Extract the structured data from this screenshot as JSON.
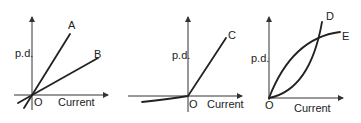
{
  "figure": {
    "panels": [
      {
        "id": "panel-1",
        "y_label": "p.d.",
        "x_label": "Current",
        "origin_label": "O",
        "curves": [
          {
            "label": "A",
            "shape": "straight line through origin, steep slope, extends into negative quadrant"
          },
          {
            "label": "B",
            "shape": "straight line through origin, shallow slope, extends into negative quadrant"
          }
        ]
      },
      {
        "id": "panel-2",
        "y_label": "p.d.",
        "x_label": "Current",
        "origin_label": "O",
        "curves": [
          {
            "label": "C",
            "shape": "straight line with positive slope for positive current; nearly flat small negative p.d. for negative current (diode-like)"
          }
        ]
      },
      {
        "id": "panel-3",
        "y_label": "p.d.",
        "x_label": "Current",
        "origin_label": "O",
        "curves": [
          {
            "label": "D",
            "shape": "curve from origin, concave up (slope increasing)"
          },
          {
            "label": "E",
            "shape": "curve from origin, concave down (slope decreasing, levelling off)"
          }
        ]
      }
    ]
  },
  "colors": {
    "ink": "#222222",
    "background": "#ffffff"
  }
}
